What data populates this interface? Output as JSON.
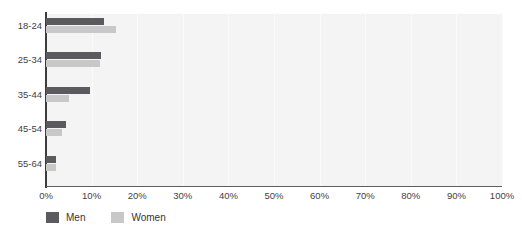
{
  "chart_data": {
    "type": "bar",
    "orientation": "horizontal",
    "title": "",
    "xlabel": "",
    "ylabel": "",
    "categories": [
      "18-24",
      "25-34",
      "35-44",
      "45-54",
      "55-64"
    ],
    "series": [
      {
        "name": "Men",
        "color": "#5a5a5f",
        "values": [
          12.7,
          12.1,
          9.6,
          4.4,
          2.2
        ]
      },
      {
        "name": "Women",
        "color": "#c8c8c8",
        "values": [
          15.3,
          11.9,
          5.0,
          3.5,
          2.2
        ]
      }
    ],
    "xlim": [
      0,
      100
    ],
    "xticks": [
      0,
      10,
      20,
      30,
      40,
      50,
      60,
      70,
      80,
      90,
      100
    ],
    "xtick_labels": [
      "0%",
      "10%",
      "20%",
      "30%",
      "40%",
      "50%",
      "60%",
      "70%",
      "80%",
      "90%",
      "100%"
    ],
    "grid": true,
    "grid_axis": "x",
    "legend_position": "bottom-left",
    "plot_background": "#f4f4f4",
    "gridline_color": "#fbfbfb",
    "axis_color": "#3b3b40"
  },
  "legend": {
    "items": [
      {
        "label": "Men",
        "color": "#5a5a5f"
      },
      {
        "label": "Women",
        "color": "#c8c8c8"
      }
    ]
  }
}
